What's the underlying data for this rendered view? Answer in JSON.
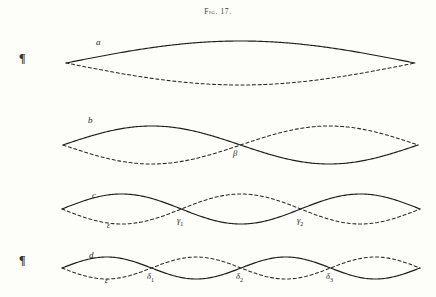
{
  "figure": {
    "title": "Fig. 17.",
    "background_color": "#fdfdfa",
    "ink_color": "#1e1e1c",
    "margin_marks": [
      {
        "glyph": "¶",
        "name": "pilcrow-top"
      },
      {
        "glyph": "¶",
        "name": "pilcrow-bottom"
      }
    ]
  },
  "chart_data": {
    "type": "line",
    "title": "Fig. 17.",
    "subtitle": "",
    "xlabel": "",
    "ylabel": "",
    "grid": false,
    "legend_position": "inline-labels",
    "xlim": [
      0,
      436
    ],
    "ylim": [
      0,
      297
    ],
    "series": [
      {
        "name": "a",
        "mode": "fundamental",
        "harmonic": 1,
        "nodes": 0,
        "antinodes": 1,
        "amplitude": 22,
        "baseline_y": 63,
        "x_start": 66,
        "x_end": 415,
        "label": "a",
        "label_x": 96,
        "label_y": 38,
        "secondary_label": "",
        "node_labels": []
      },
      {
        "name": "b",
        "mode": "first overtone",
        "harmonic": 2,
        "nodes": 1,
        "antinodes": 2,
        "amplitude": 19,
        "baseline_y": 145,
        "x_start": 63,
        "x_end": 418,
        "label": "b",
        "label_x": 88,
        "label_y": 116,
        "secondary_label": "",
        "node_labels": [
          {
            "text": "β",
            "sub": "",
            "x": 233,
            "y": 149
          }
        ]
      },
      {
        "name": "c",
        "mode": "second overtone",
        "harmonic": 3,
        "nodes": 2,
        "antinodes": 3,
        "amplitude": 15,
        "baseline_y": 209,
        "x_start": 62,
        "x_end": 420,
        "label": "c",
        "label_x": 92,
        "label_y": 191,
        "secondary_label": "ε",
        "secondary_label_x": 107,
        "secondary_label_y": 222,
        "node_labels": [
          {
            "text": "γ",
            "sub": "1",
            "x": 177,
            "y": 216
          },
          {
            "text": "γ",
            "sub": "2",
            "x": 297,
            "y": 216
          }
        ]
      },
      {
        "name": "d",
        "mode": "third overtone",
        "harmonic": 4,
        "nodes": 3,
        "antinodes": 4,
        "amplitude": 11,
        "baseline_y": 268,
        "x_start": 62,
        "x_end": 420,
        "label": "d",
        "label_x": 89,
        "label_y": 251,
        "secondary_label": "ε",
        "secondary_label_x": 105,
        "secondary_label_y": 277,
        "node_labels": [
          {
            "text": "δ",
            "sub": "1",
            "x": 147,
            "y": 272
          },
          {
            "text": "δ",
            "sub": "2",
            "x": 236,
            "y": 272
          },
          {
            "text": "δ",
            "sub": "3",
            "x": 326,
            "y": 272
          }
        ]
      }
    ]
  }
}
